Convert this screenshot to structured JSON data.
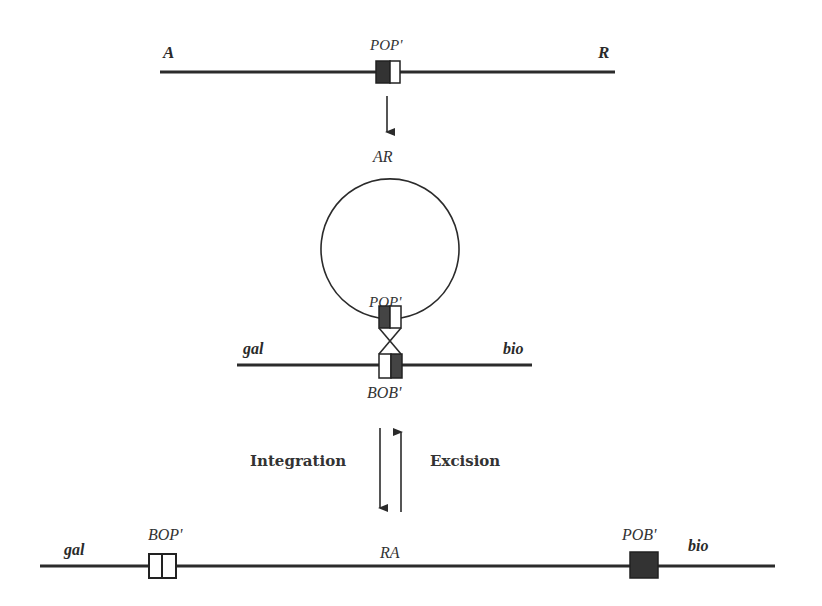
{
  "diagram": {
    "phage_linear": {
      "left_label": "A",
      "right_label": "R",
      "site_label": "POP'"
    },
    "phage_circular": {
      "label": "AR",
      "site_label": "POP'"
    },
    "bacterial_chromosome": {
      "left_label": "gal",
      "right_label": "bio",
      "site_label": "BOB'"
    },
    "process": {
      "forward_label": "Integration",
      "reverse_label": "Excision"
    },
    "prophage": {
      "left_label": "gal",
      "right_label": "bio",
      "center_label": "RA",
      "left_site_label": "BOP'",
      "right_site_label": "POB'"
    },
    "colors": {
      "line": "#2b2b2b",
      "dark_segment": "#333333",
      "light_segment": "#ffffff",
      "background": "#ffffff"
    }
  }
}
